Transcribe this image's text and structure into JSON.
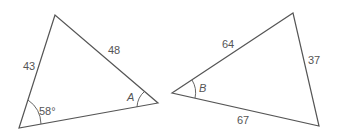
{
  "triangle_left": {
    "side_left": "43",
    "side_top_right": "48",
    "angle_bottom_left": "58°",
    "angle_right": "A"
  },
  "triangle_right": {
    "side_top_left": "64",
    "side_right": "37",
    "side_bottom": "67",
    "angle_left": "B"
  },
  "colors": {
    "line": "#555555",
    "text": "#555555"
  }
}
